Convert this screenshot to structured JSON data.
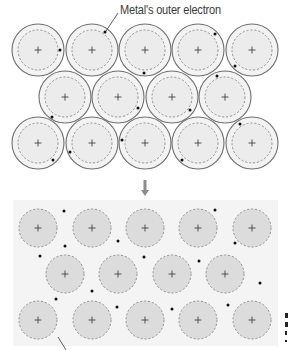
{
  "labels": {
    "outer_electron": "Metal's outer electron"
  },
  "colors": {
    "outer_shell_stroke": "#6e6e6e",
    "outer_shell_fill": "#f3f3f3",
    "inner_dashed_stroke": "#8a8a8a",
    "inner_fill_top": "#ececec",
    "inner_fill_bottom": "#dcdcdc",
    "electron": "#111111",
    "panel_bg": "#f4f4f4",
    "arrow": "#8c8c8c"
  },
  "top_lattice": {
    "description": "Metal atoms, each with one outer electron",
    "outer_radius": 26,
    "inner_radius": 20,
    "ions": [
      {
        "x": 38,
        "y": 50
      },
      {
        "x": 92,
        "y": 50
      },
      {
        "x": 145,
        "y": 50
      },
      {
        "x": 198,
        "y": 50
      },
      {
        "x": 252,
        "y": 50
      },
      {
        "x": 65,
        "y": 97
      },
      {
        "x": 118,
        "y": 97
      },
      {
        "x": 172,
        "y": 97
      },
      {
        "x": 225,
        "y": 97
      },
      {
        "x": 38,
        "y": 143
      },
      {
        "x": 92,
        "y": 143
      },
      {
        "x": 145,
        "y": 143
      },
      {
        "x": 198,
        "y": 143
      },
      {
        "x": 252,
        "y": 143
      }
    ],
    "electrons": [
      {
        "x": 60,
        "y": 50
      },
      {
        "x": 105,
        "y": 32
      },
      {
        "x": 144,
        "y": 73
      },
      {
        "x": 215,
        "y": 34
      },
      {
        "x": 235,
        "y": 66
      },
      {
        "x": 217,
        "y": 76
      },
      {
        "x": 52,
        "y": 117
      },
      {
        "x": 138,
        "y": 108
      },
      {
        "x": 190,
        "y": 110
      },
      {
        "x": 53,
        "y": 160
      },
      {
        "x": 70,
        "y": 152
      },
      {
        "x": 122,
        "y": 140
      },
      {
        "x": 182,
        "y": 160
      },
      {
        "x": 240,
        "y": 124
      }
    ]
  },
  "bottom_lattice": {
    "description": "Positive metal ions in a sea of delocalised electrons",
    "panel": {
      "x": 13,
      "y": 200,
      "width": 265,
      "height": 146
    },
    "ion_radius": 19,
    "ions": [
      {
        "x": 38,
        "y": 228
      },
      {
        "x": 92,
        "y": 228
      },
      {
        "x": 145,
        "y": 228
      },
      {
        "x": 198,
        "y": 228
      },
      {
        "x": 252,
        "y": 228
      },
      {
        "x": 65,
        "y": 274
      },
      {
        "x": 118,
        "y": 274
      },
      {
        "x": 172,
        "y": 274
      },
      {
        "x": 225,
        "y": 274
      },
      {
        "x": 38,
        "y": 320
      },
      {
        "x": 92,
        "y": 320
      },
      {
        "x": 145,
        "y": 320
      },
      {
        "x": 198,
        "y": 320
      },
      {
        "x": 252,
        "y": 320
      }
    ],
    "electrons": [
      {
        "x": 64,
        "y": 211
      },
      {
        "x": 65,
        "y": 246
      },
      {
        "x": 118,
        "y": 241
      },
      {
        "x": 40,
        "y": 256
      },
      {
        "x": 144,
        "y": 257
      },
      {
        "x": 215,
        "y": 210
      },
      {
        "x": 235,
        "y": 243
      },
      {
        "x": 199,
        "y": 261
      },
      {
        "x": 92,
        "y": 291
      },
      {
        "x": 56,
        "y": 299
      },
      {
        "x": 260,
        "y": 283
      },
      {
        "x": 117,
        "y": 307
      },
      {
        "x": 172,
        "y": 309
      },
      {
        "x": 228,
        "y": 305
      }
    ]
  },
  "arrow": {
    "x": 145,
    "y_start": 180,
    "y_end": 196,
    "direction": "down"
  },
  "leader_lines": [
    {
      "name": "outer-electron-leader",
      "x1": 118,
      "y1": 13,
      "x2": 106,
      "y2": 31
    },
    {
      "name": "bottom-leader",
      "x1": 58,
      "y1": 337,
      "x2": 66,
      "y2": 350
    }
  ]
}
